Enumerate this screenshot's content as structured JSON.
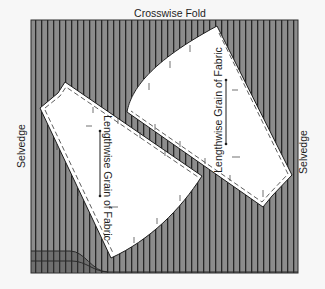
{
  "title": "Crosswise Fold",
  "labels": {
    "top": "Crosswise Fold",
    "left_edge": "Selvedge",
    "right_edge": "Selvedge"
  },
  "pieces": [
    {
      "name": "upper-right-piece",
      "grain_label": "Lengthwise Grain of Fabric",
      "grain_direction": "lengthwise"
    },
    {
      "name": "lower-left-piece",
      "grain_label": "Lengthwise Grain of Fabric",
      "grain_direction": "lengthwise"
    }
  ],
  "colors": {
    "fabric": "#8c8c8c",
    "stripe": "#262626",
    "pattern_piece": "#ffffff",
    "background": "#f7f7f7",
    "selvedge_band": "#6e6e6e"
  },
  "stripe_spacing_px": 6
}
